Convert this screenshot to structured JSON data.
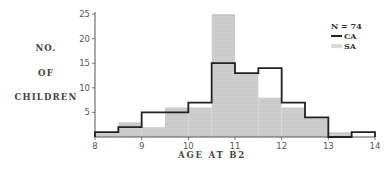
{
  "chart_data": {
    "type": "bar",
    "subtype": "overlaid histogram",
    "title": "",
    "xlabel": "AGE AT B2",
    "ylabel": "NO. OF CHILDREN",
    "xlim": [
      8,
      14
    ],
    "ylim": [
      0,
      25
    ],
    "x_ticks": [
      8,
      9,
      10,
      11,
      12,
      13,
      14
    ],
    "y_ticks": [
      5,
      10,
      15,
      20,
      25
    ],
    "bin_width": 0.5,
    "bin_edges": [
      8,
      8.5,
      9,
      9.5,
      10,
      10.5,
      11,
      11.5,
      12,
      12.5,
      13,
      13.5,
      14
    ],
    "annotation": "N = 74",
    "legend_position": "top-right",
    "series": [
      {
        "name": "CA",
        "style": "outline",
        "values": [
          1,
          2,
          5,
          5,
          7,
          15,
          13,
          14,
          7,
          4,
          0,
          1
        ]
      },
      {
        "name": "SA",
        "style": "stippled",
        "values": [
          1,
          3,
          2,
          6,
          6,
          25,
          13,
          8,
          6,
          4,
          1,
          0
        ]
      }
    ]
  },
  "labels": {
    "y_line1": "NO.",
    "y_line2": "OF",
    "y_line3": "CHILDREN",
    "x_title": "AGE AT B2",
    "n_label": "N = 74",
    "legend_ca": "CA",
    "legend_sa": "SA"
  },
  "colors": {
    "ca_line": "#222222",
    "sa_fill": "#d6d6d6",
    "sa_dot": "#777777",
    "axis": "#555555"
  }
}
